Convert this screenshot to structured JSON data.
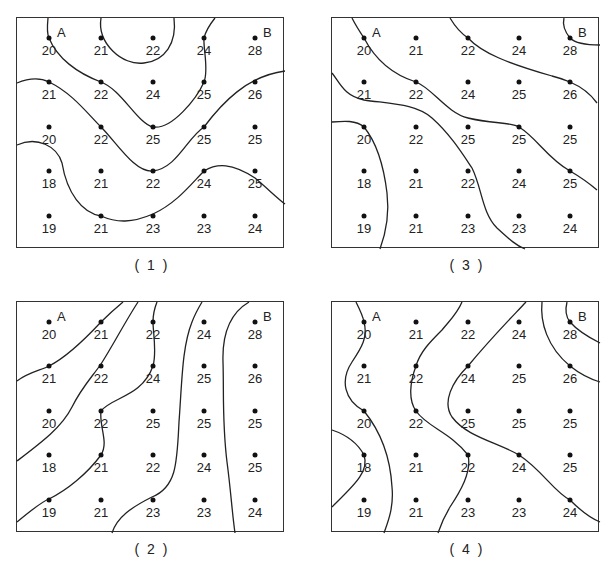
{
  "grid": {
    "rows": [
      [
        20,
        21,
        22,
        24,
        28
      ],
      [
        21,
        22,
        24,
        25,
        26
      ],
      [
        20,
        22,
        25,
        25,
        25
      ],
      [
        18,
        21,
        22,
        24,
        25
      ],
      [
        19,
        21,
        23,
        23,
        24
      ]
    ],
    "corner_labels": {
      "top_left": "A",
      "top_right": "B"
    }
  },
  "panels": [
    {
      "id": "1",
      "caption": "( 1 )",
      "left": 16,
      "top": 17,
      "contours": [
        "M31,0 C30,10 30,16 32,20 C40,40 60,55 84,64 C105,72 120,105 136,109 C155,112 180,80 187,64 C192,52 186,30 187,20 C189,12 194,5 198,0",
        "M84,0 C80,25 105,48 127,45 C148,43 160,25 157,0",
        "M0,65 C12,60 24,60 32,64 C55,75 70,95 84,109 C100,125 118,155 136,153 C160,150 170,120 187,109 C205,85 230,58 268,53",
        "M0,127 C20,118 40,128 45,145 C50,175 65,195 84,198 C100,205 115,205 136,196 C160,185 175,165 187,153 C200,145 215,145 238,160 C250,170 260,180 268,186"
      ]
    },
    {
      "id": "3",
      "caption": "( 3 )",
      "left": 331,
      "top": 17,
      "contours": [
        "M20,0 C24,8 28,14 32,20 C45,45 65,58 84,64 C100,70 115,95 136,100 C160,106 180,104 187,109 C205,120 215,140 238,153 C250,160 258,166 265,172",
        "M118,0 C124,10 130,16 136,20 C150,35 175,45 220,58 C228,60 233,62 238,64 C252,70 260,78 265,85",
        "M232,0 C230,8 234,15 238,20 C244,26 255,27 268,27",
        "M0,55 C8,65 12,78 32,82 C60,86 84,86 100,100 C118,116 130,135 140,150 C150,170 150,195 165,210 C178,222 185,228 193,231",
        "M0,104 C12,103 24,102 32,109 C45,125 52,150 55,175 C58,200 52,220 48,231"
      ]
    },
    {
      "id": "2",
      "caption": "( 2 )",
      "left": 16,
      "top": 301,
      "contours": [
        "M0,79 C12,70 25,68 32,64 C50,55 70,35 84,20 C92,12 100,5 106,0",
        "M0,159 C25,140 45,125 55,105 C65,85 75,75 84,62 C95,45 108,20 121,0",
        "M0,220 C12,210 24,200 32,197 C50,188 70,172 84,153 C92,140 82,125 84,109 C95,95 125,95 136,64 C140,50 136,30 136,20 C136,12 138,5 140,0",
        "M95,231 C100,215 115,205 135,195 C160,185 160,160 162,120 C165,80 165,45 175,20 C178,12 182,5 185,0",
        "M232,0 C215,10 205,30 206,60 C207,90 205,120 210,160 C214,190 215,210 218,231"
      ]
    },
    {
      "id": "4",
      "caption": "( 4 )",
      "left": 331,
      "top": 301,
      "contours": [
        "M24,0 C28,8 31,14 32,20 C36,35 30,45 20,60 C8,78 12,98 32,109 C45,125 58,150 60,185 C62,205 56,220 52,231",
        "M0,128 C12,132 25,140 32,153 C38,170 20,185 0,205",
        "M130,0 C125,12 118,18 110,28 C98,40 88,50 84,64 C78,80 76,98 84,109 C95,125 118,130 136,153 C140,170 128,190 118,205 C112,215 108,225 106,231",
        "M194,0 C180,15 160,35 136,64 C120,80 110,100 120,115 C135,135 165,140 187,153 C210,168 222,190 238,198 C250,210 258,216 268,220",
        "M210,0 C208,20 215,45 238,64 C248,72 258,77 268,80",
        "M235,0 C233,8 234,15 238,20 C245,28 258,36 268,41"
      ]
    }
  ]
}
